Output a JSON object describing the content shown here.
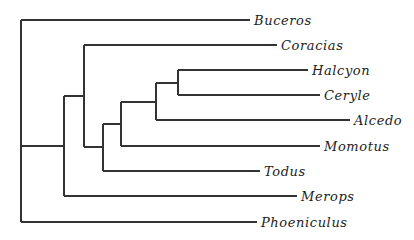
{
  "diagram": {
    "type": "phylogenetic-tree (cladogram)",
    "line_color": "#333333",
    "taxa": [
      {
        "name": "Buceros",
        "y": 20,
        "x_end": 250
      },
      {
        "name": "Coracias",
        "y": 45,
        "x_end": 277
      },
      {
        "name": "Halcyon",
        "y": 70,
        "x_end": 308
      },
      {
        "name": "Ceryle",
        "y": 95,
        "x_end": 320
      },
      {
        "name": "Alcedo",
        "y": 120,
        "x_end": 350
      },
      {
        "name": "Momotus",
        "y": 146,
        "x_end": 320
      },
      {
        "name": "Todus",
        "y": 171,
        "x_end": 260
      },
      {
        "name": "Merops",
        "y": 196,
        "x_end": 297
      },
      {
        "name": "Phoeniculus",
        "y": 222,
        "x_end": 257
      }
    ],
    "nodes": [
      {
        "id": "root",
        "x": 21,
        "y_top": 20,
        "y_bottom": 222
      },
      {
        "id": "merops-clade",
        "x": 64,
        "y_top": 96,
        "y_bottom": 196,
        "attach_y": 146
      },
      {
        "id": "coracias-clade",
        "x": 84,
        "y_top": 45,
        "y_bottom": 147,
        "attach_y": 96
      },
      {
        "id": "todus-clade",
        "x": 103,
        "y_top": 124,
        "y_bottom": 171,
        "attach_y": 147
      },
      {
        "id": "momotus-clade",
        "x": 121,
        "y_top": 102,
        "y_bottom": 146,
        "attach_y": 124
      },
      {
        "id": "alcedo-clade",
        "x": 156,
        "y_top": 83,
        "y_bottom": 120,
        "attach_y": 102
      },
      {
        "id": "halcyon-ceryle",
        "x": 178,
        "y_top": 70,
        "y_bottom": 95,
        "attach_y": 83
      }
    ]
  }
}
